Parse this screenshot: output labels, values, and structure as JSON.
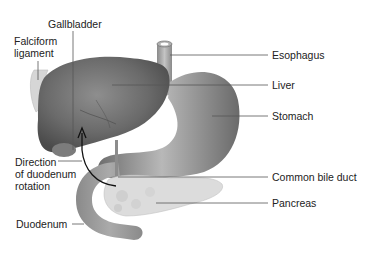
{
  "diagram": {
    "colors": {
      "background": "#ffffff",
      "text": "#222222",
      "leader_line": "#555555",
      "organ_dark": "#5a5a5a",
      "organ_mid": "#8a8a8a",
      "organ_light": "#c8c8c8",
      "pancreas": "#d8d8d8"
    },
    "labels": {
      "gallbladder": "Gallbladder",
      "falciform_ligament": "Falciform\nligament",
      "esophagus": "Esophagus",
      "liver": "Liver",
      "stomach": "Stomach",
      "direction_of_rotation": "Direction\nof duodenum\nrotation",
      "common_bile_duct": "Common bile duct",
      "pancreas": "Pancreas",
      "duodenum": "Duodenum"
    }
  }
}
